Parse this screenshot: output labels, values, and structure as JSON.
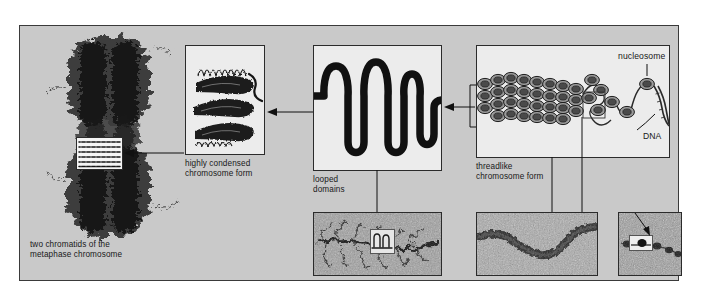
{
  "figure": {
    "background_color": "#c9c9c9",
    "panel_color": "#ececec",
    "ink_color": "#181818"
  },
  "panels": [
    {
      "id": "metaphase",
      "name": "metaphase-chromosome",
      "caption_line1": "two chromatids of the",
      "caption_line2": "metaphase chromosome",
      "kind": "electron-micrograph",
      "has_inset_box": true,
      "inset_contents": "parallel condensed coils"
    },
    {
      "id": "condensed",
      "name": "highly-condensed-chromosome-form",
      "caption_line1": "highly condensed",
      "caption_line2": "chromosome form",
      "kind": "drawing",
      "structure": "solenoid coil, 3 thick turns"
    },
    {
      "id": "looped",
      "name": "looped-domains",
      "caption_line1": "looped",
      "caption_line2": "domains",
      "kind": "drawing",
      "structure": "thick fiber with 6 looped domains"
    },
    {
      "id": "threadlike",
      "name": "threadlike-chromosome-form",
      "caption_line1": "threadlike",
      "caption_line2": "chromosome form",
      "kind": "drawing",
      "structure": "30 nm fiber unravelling to beads-on-a-string",
      "labels": [
        {
          "text": "nucleosome",
          "name": "nucleosome-label"
        },
        {
          "text": "DNA",
          "name": "dna-label"
        }
      ]
    }
  ],
  "micrographs": [
    {
      "id": "m-looped",
      "name": "micrograph-looped-domains",
      "inset": true
    },
    {
      "id": "m-threadlike",
      "name": "micrograph-30nm-fiber",
      "inset": false
    },
    {
      "id": "m-nucleosome",
      "name": "micrograph-beads-on-a-string",
      "inset": true
    }
  ],
  "connectors": [
    {
      "name": "arrow-condensed-to-metaphase",
      "direction": "left"
    },
    {
      "name": "arrow-looped-to-condensed",
      "direction": "left"
    },
    {
      "name": "arrow-threadlike-to-looped",
      "direction": "left"
    }
  ]
}
